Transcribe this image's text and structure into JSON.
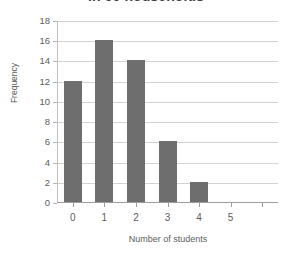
{
  "chart_data": {
    "type": "bar",
    "title": "in 50 households",
    "xlabel": "Number of students",
    "ylabel": "Frequency",
    "categories": [
      "0",
      "1",
      "2",
      "3",
      "4",
      "5"
    ],
    "values": [
      12,
      16,
      14,
      6,
      2,
      0
    ],
    "ylim": [
      0,
      18
    ],
    "ytick_labels": [
      "0",
      "2",
      "4",
      "6",
      "8",
      "10",
      "12",
      "14",
      "16",
      "18"
    ],
    "ytick_values": [
      0,
      2,
      4,
      6,
      8,
      10,
      12,
      14,
      16,
      18
    ],
    "grid": true,
    "legend": false,
    "bar_color": "#6e6e6e",
    "grid_color": "#d2d2d2",
    "axis_color": "#9d9d9d",
    "background_color": "#ffffff"
  }
}
